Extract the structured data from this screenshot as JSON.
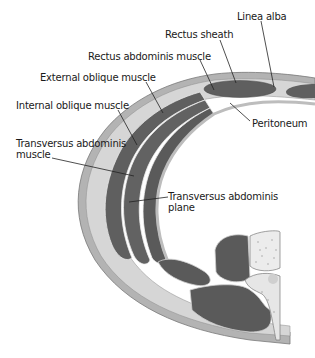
{
  "diagram": {
    "type": "anatomical cross-section",
    "labels": [
      {
        "id": "linea-alba",
        "text": "Linea alba"
      },
      {
        "id": "rectus-sheath",
        "text": "Rectus sheath"
      },
      {
        "id": "rectus-abdominis",
        "text": "Rectus abdominis muscle"
      },
      {
        "id": "external-oblique",
        "text": "External oblique muscle"
      },
      {
        "id": "internal-oblique",
        "text": "Internal oblique muscle"
      },
      {
        "id": "transversus-abdominis",
        "line1": "Transversus abdominis",
        "line2": "muscle"
      },
      {
        "id": "peritoneum",
        "text": "Peritoneum"
      },
      {
        "id": "tap",
        "line1": "Transversus abdominis",
        "line2": "plane"
      }
    ],
    "colors": {
      "muscle": "#5e5e5e",
      "fascia": "#c9c9c9",
      "skin": "#b5b5b5",
      "fat": "#e2e2e2",
      "bone": "#ececec",
      "outline": "#7a7a7a",
      "leader": "#222222"
    }
  }
}
